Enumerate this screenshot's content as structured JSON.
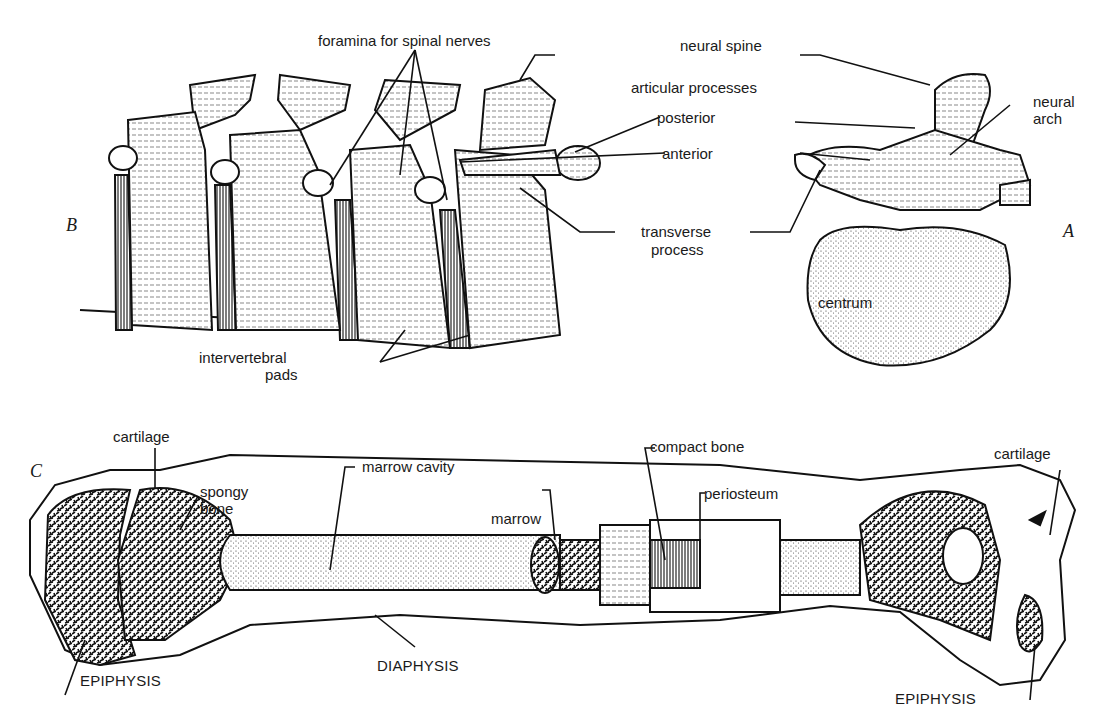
{
  "figure": {
    "panels": [
      {
        "id": "A",
        "letter": "A",
        "subject": "vertebra (end view)"
      },
      {
        "id": "B",
        "letter": "B",
        "subject": "vertebral column (side view)"
      },
      {
        "id": "C",
        "letter": "C",
        "subject": "long bone (longitudinal section)"
      }
    ],
    "labels": {
      "foramina": "foramina for spinal nerves",
      "neural_spine": "neural spine",
      "articular_processes": "articular processes",
      "posterior": "posterior",
      "anterior": "anterior",
      "neural_arch_1": "neural",
      "neural_arch_2": "arch",
      "transverse_1": "transverse",
      "transverse_2": "process",
      "centrum": "centrum",
      "intervertebral_1": "intervertebral",
      "intervertebral_2": "pads",
      "cartilage_left": "cartilage",
      "spongy_1": "spongy",
      "spongy_2": "bone",
      "marrow_cavity": "marrow cavity",
      "compact_bone": "compact bone",
      "periosteum": "periosteum",
      "marrow": "marrow",
      "cartilage_right": "cartilage",
      "epiphysis_left": "EPIPHYSIS",
      "diaphysis": "DIAPHYSIS",
      "epiphysis_right": "EPIPHYSIS"
    }
  }
}
